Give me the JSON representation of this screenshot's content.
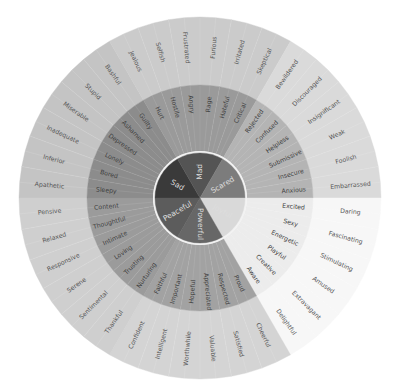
{
  "wheel": {
    "center": [
      200,
      198
    ],
    "radii": {
      "core": 45,
      "core_border": 47,
      "middle": 113,
      "outer": 181
    },
    "stripe_color": "#ffffff",
    "sectors": [
      {
        "name": "Sad",
        "start_angle": 180,
        "end_angle": 120,
        "colors": {
          "core": "#3a3a3a",
          "middle": "#8c8c8c",
          "outer": "#c4c4c4",
          "core_text": "#d6d6d6"
        },
        "middle": [
          "Sleepy",
          "Bored",
          "Lonely",
          "Depressed",
          "Ashamed",
          "Guilty"
        ],
        "outer": [
          "Apathetic",
          "Inferior",
          "Inadequate",
          "Miserable",
          "Stupid",
          "Bashful"
        ]
      },
      {
        "name": "Mad",
        "start_angle": 120,
        "end_angle": 60,
        "colors": {
          "core": "#545454",
          "middle": "#9a9a9a",
          "outer": "#cbcbcb",
          "core_text": "#bbbbbb"
        },
        "middle": [
          "Hurt",
          "Hostile",
          "Angry",
          "Rage",
          "Hateful",
          "Critical"
        ],
        "outer": [
          "Jealous",
          "Selfish",
          "Frustrated",
          "Furious",
          "Irritated",
          "Skeptical"
        ]
      },
      {
        "name": "Scared",
        "start_angle": 60,
        "end_angle": 0,
        "colors": {
          "core": "#7c7c7c",
          "middle": "#b4b4b4",
          "outer": "#dadada",
          "core_text": "#c8c8c8"
        },
        "middle": [
          "Rejected",
          "Confused",
          "Helpless",
          "Submissive",
          "Insecure",
          "Anxious"
        ],
        "outer": [
          "Bewildered",
          "Discouraged",
          "Insignificant",
          "Weak",
          "Foolish",
          "Embarrassed"
        ]
      },
      {
        "name": "Joyful",
        "start_angle": 0,
        "end_angle": -60,
        "colors": {
          "core": "#d9d9d9",
          "middle": "#ececec",
          "outer": "#f7f7f7",
          "core_text": "#6e6e6e"
        },
        "middle": [
          "Excited",
          "Sexy",
          "Energetic",
          "Playful",
          "Creative",
          "Aware"
        ],
        "outer": [
          "Daring",
          "Fascinating",
          "Stimulating",
          "Amused",
          "Extravagant",
          "Delightful"
        ]
      },
      {
        "name": "Powerful",
        "start_angle": -60,
        "end_angle": -120,
        "colors": {
          "core": "#676767",
          "middle": "#a2a2a2",
          "outer": "#d4d4d4",
          "core_text": "#c4c4c4"
        },
        "middle": [
          "Proud",
          "Respected",
          "Appreciated",
          "Hopeful",
          "Important",
          "Faithful"
        ],
        "outer": [
          "Cheerful",
          "Satisfied",
          "Valuable",
          "Worthwhile",
          "Intelligent",
          "Confident"
        ]
      },
      {
        "name": "Peaceful",
        "start_angle": -120,
        "end_angle": -180,
        "colors": {
          "core": "#5c5c5c",
          "middle": "#9b9b9b",
          "outer": "#cfcfcf",
          "core_text": "#c0c0c0"
        },
        "middle": [
          "Nurturing",
          "Trusting",
          "Loving",
          "Intimate",
          "Thoughtful",
          "Content"
        ],
        "outer": [
          "Thankful",
          "Sentimental",
          "Serene",
          "Responsive",
          "Relaxed",
          "Pensive"
        ]
      }
    ]
  }
}
